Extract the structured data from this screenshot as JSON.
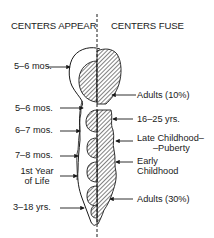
{
  "headers": {
    "left": "CENTERS APPEAR",
    "right": "CENTERS FUSE"
  },
  "appear_labels": [
    {
      "text": "5–6 mos."
    },
    {
      "text": "5–6 mos."
    },
    {
      "text": "6–7 mos."
    },
    {
      "text": "7–8 mos."
    },
    {
      "line1": "1st Year",
      "line2": "of Life"
    },
    {
      "text": "3–18 yrs."
    }
  ],
  "fuse_labels": [
    {
      "text": "Adults (10%)"
    },
    {
      "text": "16–25 yrs."
    },
    {
      "line1": "Late Childhood–",
      "line2": "–Puberty"
    },
    {
      "line1": "Early",
      "line2": "Childhood"
    },
    {
      "text": "Adults (30%)"
    }
  ],
  "colors": {
    "ink": "#1a1a1a",
    "background": "#ffffff"
  }
}
